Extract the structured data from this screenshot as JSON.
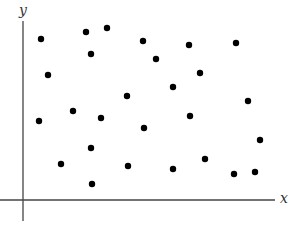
{
  "chart_data": {
    "type": "scatter",
    "title": "",
    "xlabel": "x",
    "ylabel": "y",
    "grid": false,
    "legend": null,
    "ticks": "none",
    "xlim": [
      -23,
      252
    ],
    "ylim": [
      -21,
      179
    ],
    "units_note": "unitless; origin at axes intersection, y upward",
    "points": [
      {
        "x": 18,
        "y": 161
      },
      {
        "x": 63,
        "y": 168
      },
      {
        "x": 84,
        "y": 172
      },
      {
        "x": 120,
        "y": 159
      },
      {
        "x": 166,
        "y": 155
      },
      {
        "x": 213,
        "y": 157
      },
      {
        "x": 68,
        "y": 146
      },
      {
        "x": 133,
        "y": 141
      },
      {
        "x": 25,
        "y": 125
      },
      {
        "x": 177,
        "y": 127
      },
      {
        "x": 150,
        "y": 113
      },
      {
        "x": 104,
        "y": 104
      },
      {
        "x": 225,
        "y": 99
      },
      {
        "x": 50,
        "y": 89
      },
      {
        "x": 16,
        "y": 79
      },
      {
        "x": 78,
        "y": 82
      },
      {
        "x": 167,
        "y": 84
      },
      {
        "x": 121,
        "y": 72
      },
      {
        "x": 237,
        "y": 60
      },
      {
        "x": 68,
        "y": 52
      },
      {
        "x": 182,
        "y": 41
      },
      {
        "x": 38,
        "y": 36
      },
      {
        "x": 105,
        "y": 34
      },
      {
        "x": 150,
        "y": 31
      },
      {
        "x": 211,
        "y": 26
      },
      {
        "x": 232,
        "y": 28
      },
      {
        "x": 69,
        "y": 16
      }
    ]
  },
  "style": {
    "axis_color": "#444444",
    "point_color": "#000000",
    "point_radius": 3.2
  }
}
